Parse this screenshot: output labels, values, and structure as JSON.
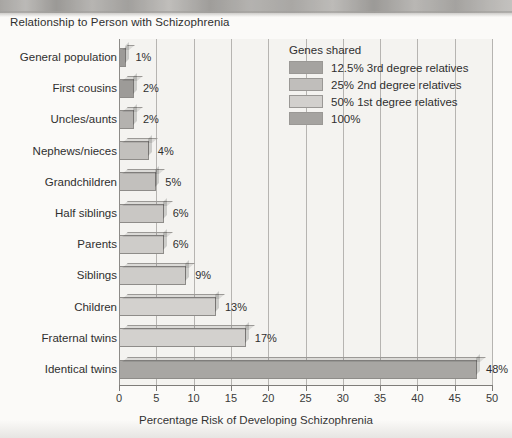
{
  "chart_data": {
    "type": "bar",
    "orientation": "horizontal",
    "title": "Relationship to Person with Schizophrenia",
    "xlabel": "Percentage Risk of Developing Schizophrenia",
    "ylabel": "",
    "xlim": [
      0,
      50
    ],
    "xticks": [
      0,
      5,
      10,
      15,
      20,
      25,
      30,
      35,
      40,
      45,
      50
    ],
    "grid": "vertical",
    "legend_position": "upper-right-inside",
    "categories": [
      "General population",
      "First cousins",
      "Uncles/aunts",
      "Nephews/nieces",
      "Grandchildren",
      "Half siblings",
      "Parents",
      "Siblings",
      "Children",
      "Fraternal twins",
      "Identical twins"
    ],
    "values": [
      1,
      2,
      2,
      4,
      5,
      6,
      6,
      9,
      13,
      17,
      48
    ],
    "value_labels": [
      "1%",
      "2%",
      "2%",
      "4%",
      "5%",
      "6%",
      "6%",
      "9%",
      "13%",
      "17%",
      "48%"
    ],
    "group_by_category": [
      "12.5% 3rd degree relatives",
      "12.5% 3rd degree relatives",
      "12.5% 3rd degree relatives",
      "25% 2nd degree relatives",
      "25% 2nd degree relatives",
      "25% 2nd degree relatives",
      "50% 1st degree relatives",
      "50% 1st degree relatives",
      "50% 1st degree relatives",
      "50% 1st degree relatives",
      "100%"
    ],
    "colors_by_category": [
      "#9d9b98",
      "#9d9b98",
      "#b4b2af",
      "#c2c0bd",
      "#c2c0bd",
      "#c9c7c4",
      "#ceccc9",
      "#ceccc9",
      "#d3d1ce",
      "#d3d1ce",
      "#a8a6a3"
    ],
    "legend": {
      "title": "Genes shared",
      "entries": [
        {
          "label": "12.5% 3rd degree relatives",
          "color": "#a5a3a0"
        },
        {
          "label": "25% 2nd degree relatives",
          "color": "#c0bebb"
        },
        {
          "label": "50% 1st degree relatives",
          "color": "#d2d0cd"
        },
        {
          "label": "100%",
          "color": "#a5a3a0"
        }
      ]
    },
    "plot_background": "#f4f3f0",
    "gridline_color": "#b6b4b1",
    "axis_color": "#7e7c79"
  }
}
